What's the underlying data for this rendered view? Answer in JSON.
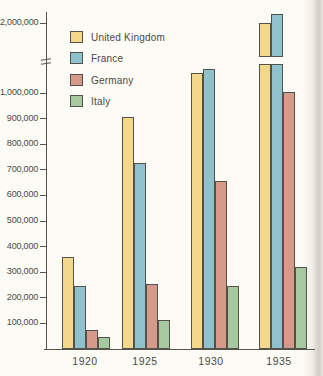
{
  "chart_data": {
    "type": "bar",
    "title": "",
    "xlabel": "",
    "ylabel": "",
    "grid": false,
    "legend_position": "top-left-inside",
    "categories": [
      "1920",
      "1925",
      "1930",
      "1935"
    ],
    "series": [
      {
        "name": "United Kingdom",
        "color": "#f3d78b",
        "values": [
          360000,
          905000,
          1080000,
          2000000
        ]
      },
      {
        "name": "France",
        "color": "#90c2cd",
        "values": [
          245000,
          725000,
          1095000,
          2200000
        ]
      },
      {
        "name": "Germany",
        "color": "#d69a8a",
        "values": [
          75000,
          255000,
          655000,
          1005000
        ]
      },
      {
        "name": "Italy",
        "color": "#a7c9a0",
        "values": [
          45000,
          115000,
          245000,
          320000
        ]
      }
    ],
    "yticks": [
      {
        "label": "100,000",
        "value": 100000
      },
      {
        "label": "200,000",
        "value": 200000
      },
      {
        "label": "300,000",
        "value": 300000
      },
      {
        "label": "400,000",
        "value": 400000
      },
      {
        "label": "500,000",
        "value": 500000
      },
      {
        "label": "600,000",
        "value": 600000
      },
      {
        "label": "700,000",
        "value": 700000
      },
      {
        "label": "800,000",
        "value": 800000
      },
      {
        "label": "900,000",
        "value": 900000
      },
      {
        "label": "1,000,000",
        "value": 1000000
      },
      {
        "label": "2,000,000",
        "value": 2000000
      }
    ],
    "ylim": [
      0,
      2200000
    ],
    "axis_break": {
      "present": true,
      "between": [
        1100000,
        2000000
      ],
      "bars_crossing_break": [
        "United Kingdom 1935",
        "France 1935"
      ]
    }
  },
  "colors": {
    "background": "#fcfbf5",
    "axis": "#55544a",
    "bar_outline": "#53514a",
    "text": "#4a4a42"
  }
}
